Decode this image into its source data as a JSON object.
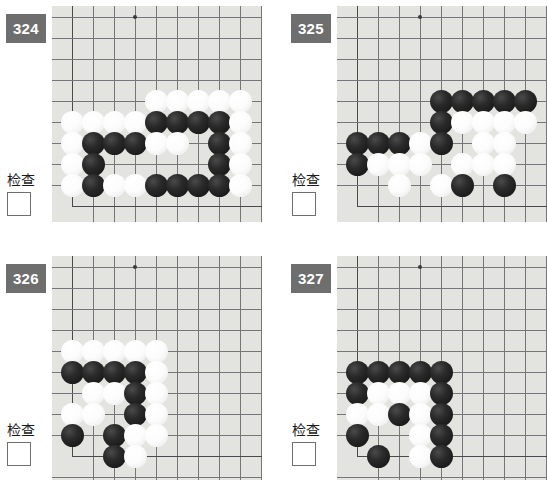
{
  "page": {
    "background_color": "#ffffff",
    "badge_color": "#6e6e6e",
    "board_background_color": "#e3e3e0",
    "grid_line_color": "#76767a",
    "black_stone_color": "#1b1b1b",
    "white_stone_color": "#fcfcfc"
  },
  "common": {
    "check_label": "检查",
    "checkbox_state": "unchecked",
    "checkbox_value": ""
  },
  "problems": [
    {
      "number": "324",
      "check_label": "检查",
      "grid": {
        "cols": 9,
        "rows": 10,
        "spacing": 21,
        "star_points": [
          [
            3,
            1
          ]
        ]
      },
      "board_edges": {
        "left": true,
        "bottom": true,
        "top": false,
        "right": false
      },
      "stones": [
        {
          "c": 4,
          "r": 5,
          "color": "w"
        },
        {
          "c": 5,
          "r": 5,
          "color": "w"
        },
        {
          "c": 6,
          "r": 5,
          "color": "w"
        },
        {
          "c": 7,
          "r": 5,
          "color": "w"
        },
        {
          "c": 8,
          "r": 5,
          "color": "w"
        },
        {
          "c": 0,
          "r": 6,
          "color": "w"
        },
        {
          "c": 1,
          "r": 6,
          "color": "w"
        },
        {
          "c": 2,
          "r": 6,
          "color": "w"
        },
        {
          "c": 3,
          "r": 6,
          "color": "w"
        },
        {
          "c": 4,
          "r": 6,
          "color": "b"
        },
        {
          "c": 5,
          "r": 6,
          "color": "b"
        },
        {
          "c": 6,
          "r": 6,
          "color": "b"
        },
        {
          "c": 7,
          "r": 6,
          "color": "b"
        },
        {
          "c": 8,
          "r": 6,
          "color": "w"
        },
        {
          "c": 0,
          "r": 7,
          "color": "w"
        },
        {
          "c": 1,
          "r": 7,
          "color": "b"
        },
        {
          "c": 2,
          "r": 7,
          "color": "b"
        },
        {
          "c": 3,
          "r": 7,
          "color": "b"
        },
        {
          "c": 4,
          "r": 7,
          "color": "w"
        },
        {
          "c": 5,
          "r": 7,
          "color": "w"
        },
        {
          "c": 7,
          "r": 7,
          "color": "b"
        },
        {
          "c": 8,
          "r": 7,
          "color": "w"
        },
        {
          "c": 0,
          "r": 8,
          "color": "w"
        },
        {
          "c": 1,
          "r": 8,
          "color": "b"
        },
        {
          "c": 7,
          "r": 8,
          "color": "b"
        },
        {
          "c": 8,
          "r": 8,
          "color": "w"
        },
        {
          "c": 0,
          "r": 9,
          "color": "w"
        },
        {
          "c": 1,
          "r": 9,
          "color": "b"
        },
        {
          "c": 2,
          "r": 9,
          "color": "w"
        },
        {
          "c": 3,
          "r": 9,
          "color": "w"
        },
        {
          "c": 4,
          "r": 9,
          "color": "b"
        },
        {
          "c": 5,
          "r": 9,
          "color": "b"
        },
        {
          "c": 6,
          "r": 9,
          "color": "b"
        },
        {
          "c": 7,
          "r": 9,
          "color": "b"
        },
        {
          "c": 8,
          "r": 9,
          "color": "w"
        }
      ]
    },
    {
      "number": "325",
      "check_label": "检查",
      "grid": {
        "cols": 9,
        "rows": 10,
        "spacing": 21,
        "star_points": [
          [
            3,
            1
          ],
          [
            3,
            7
          ]
        ]
      },
      "board_edges": {
        "left": true,
        "bottom": true,
        "top": false,
        "right": false
      },
      "stones": [
        {
          "c": 4,
          "r": 5,
          "color": "b"
        },
        {
          "c": 5,
          "r": 5,
          "color": "b"
        },
        {
          "c": 6,
          "r": 5,
          "color": "b"
        },
        {
          "c": 7,
          "r": 5,
          "color": "b"
        },
        {
          "c": 8,
          "r": 5,
          "color": "b"
        },
        {
          "c": 4,
          "r": 6,
          "color": "b"
        },
        {
          "c": 5,
          "r": 6,
          "color": "w"
        },
        {
          "c": 6,
          "r": 6,
          "color": "w"
        },
        {
          "c": 7,
          "r": 6,
          "color": "w"
        },
        {
          "c": 8,
          "r": 6,
          "color": "w"
        },
        {
          "c": 0,
          "r": 7,
          "color": "b"
        },
        {
          "c": 1,
          "r": 7,
          "color": "b"
        },
        {
          "c": 2,
          "r": 7,
          "color": "b"
        },
        {
          "c": 3,
          "r": 7,
          "color": "w"
        },
        {
          "c": 4,
          "r": 7,
          "color": "b"
        },
        {
          "c": 6,
          "r": 7,
          "color": "w"
        },
        {
          "c": 7,
          "r": 7,
          "color": "w"
        },
        {
          "c": 0,
          "r": 8,
          "color": "b"
        },
        {
          "c": 1,
          "r": 8,
          "color": "w"
        },
        {
          "c": 2,
          "r": 8,
          "color": "w"
        },
        {
          "c": 3,
          "r": 8,
          "color": "w"
        },
        {
          "c": 5,
          "r": 8,
          "color": "w"
        },
        {
          "c": 6,
          "r": 8,
          "color": "w"
        },
        {
          "c": 7,
          "r": 8,
          "color": "w"
        },
        {
          "c": 2,
          "r": 9,
          "color": "w"
        },
        {
          "c": 4,
          "r": 9,
          "color": "w"
        },
        {
          "c": 5,
          "r": 9,
          "color": "b"
        },
        {
          "c": 7,
          "r": 9,
          "color": "b"
        }
      ]
    },
    {
      "number": "326",
      "check_label": "检查",
      "grid": {
        "cols": 9,
        "rows": 10,
        "spacing": 21,
        "star_points": [
          [
            3,
            1
          ]
        ]
      },
      "board_edges": {
        "left": true,
        "bottom": true,
        "top": false,
        "right": false
      },
      "stones": [
        {
          "c": 0,
          "r": 5,
          "color": "w"
        },
        {
          "c": 1,
          "r": 5,
          "color": "w"
        },
        {
          "c": 2,
          "r": 5,
          "color": "w"
        },
        {
          "c": 3,
          "r": 5,
          "color": "w"
        },
        {
          "c": 4,
          "r": 5,
          "color": "w"
        },
        {
          "c": 0,
          "r": 6,
          "color": "b"
        },
        {
          "c": 1,
          "r": 6,
          "color": "b"
        },
        {
          "c": 2,
          "r": 6,
          "color": "b"
        },
        {
          "c": 3,
          "r": 6,
          "color": "b"
        },
        {
          "c": 4,
          "r": 6,
          "color": "w"
        },
        {
          "c": 1,
          "r": 7,
          "color": "w"
        },
        {
          "c": 2,
          "r": 7,
          "color": "w"
        },
        {
          "c": 3,
          "r": 7,
          "color": "b"
        },
        {
          "c": 4,
          "r": 7,
          "color": "w"
        },
        {
          "c": 0,
          "r": 8,
          "color": "w"
        },
        {
          "c": 1,
          "r": 8,
          "color": "w"
        },
        {
          "c": 3,
          "r": 8,
          "color": "b"
        },
        {
          "c": 4,
          "r": 8,
          "color": "w"
        },
        {
          "c": 0,
          "r": 9,
          "color": "b"
        },
        {
          "c": 2,
          "r": 9,
          "color": "b"
        },
        {
          "c": 3,
          "r": 9,
          "color": "w"
        },
        {
          "c": 4,
          "r": 9,
          "color": "w"
        },
        {
          "c": 2,
          "r": 10,
          "color": "b"
        },
        {
          "c": 3,
          "r": 10,
          "color": "w"
        }
      ]
    },
    {
      "number": "327",
      "check_label": "检查",
      "grid": {
        "cols": 9,
        "rows": 10,
        "spacing": 21,
        "star_points": [
          [
            3,
            1
          ]
        ]
      },
      "board_edges": {
        "left": true,
        "bottom": true,
        "top": false,
        "right": false
      },
      "stones": [
        {
          "c": 0,
          "r": 6,
          "color": "b"
        },
        {
          "c": 1,
          "r": 6,
          "color": "b"
        },
        {
          "c": 2,
          "r": 6,
          "color": "b"
        },
        {
          "c": 3,
          "r": 6,
          "color": "b"
        },
        {
          "c": 4,
          "r": 6,
          "color": "b"
        },
        {
          "c": 0,
          "r": 7,
          "color": "b"
        },
        {
          "c": 1,
          "r": 7,
          "color": "w"
        },
        {
          "c": 2,
          "r": 7,
          "color": "w"
        },
        {
          "c": 3,
          "r": 7,
          "color": "w"
        },
        {
          "c": 4,
          "r": 7,
          "color": "b"
        },
        {
          "c": 0,
          "r": 8,
          "color": "w"
        },
        {
          "c": 1,
          "r": 8,
          "color": "w"
        },
        {
          "c": 2,
          "r": 8,
          "color": "b"
        },
        {
          "c": 3,
          "r": 8,
          "color": "w"
        },
        {
          "c": 4,
          "r": 8,
          "color": "b"
        },
        {
          "c": 0,
          "r": 9,
          "color": "b"
        },
        {
          "c": 3,
          "r": 9,
          "color": "w"
        },
        {
          "c": 4,
          "r": 9,
          "color": "b"
        },
        {
          "c": 1,
          "r": 10,
          "color": "b"
        },
        {
          "c": 3,
          "r": 10,
          "color": "w"
        },
        {
          "c": 4,
          "r": 10,
          "color": "b"
        }
      ]
    }
  ],
  "layout": {
    "cells": [
      {
        "left": 0,
        "top": 0,
        "width": 255,
        "height": 243,
        "board_left": 52,
        "board_width": 210,
        "board_height": 216
      },
      {
        "left": 285,
        "top": 0,
        "width": 224,
        "height": 243,
        "board_left": 52,
        "board_width": 210,
        "board_height": 216
      },
      {
        "left": 0,
        "top": 250,
        "width": 255,
        "height": 235,
        "board_left": 52,
        "board_width": 210,
        "board_height": 224
      },
      {
        "left": 285,
        "top": 250,
        "width": 224,
        "height": 235,
        "board_left": 52,
        "board_width": 210,
        "board_height": 224
      }
    ]
  }
}
